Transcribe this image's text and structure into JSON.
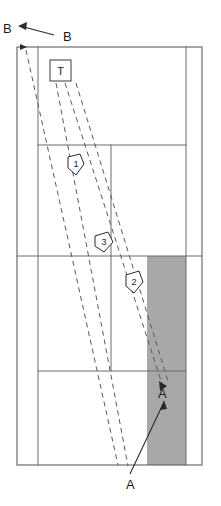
{
  "diagram": {
    "canvas": {
      "width": 221,
      "height": 506,
      "background": "#ffffff"
    },
    "colors": {
      "frame_stroke": "#5f5f5f",
      "inner_stroke": "#6b6b6b",
      "shaded_region_fill": "#a8a8a8",
      "dashed_line": "#5a5a5a",
      "leader_line": "#2b2b2b",
      "text": "#1a1a1a"
    },
    "outer_frame": {
      "x": 17,
      "y": 47,
      "width": 185,
      "height": 418
    },
    "shaded_region": {
      "x": 147,
      "y": 256,
      "width": 39,
      "height": 209,
      "fill": "#a8a8a8"
    },
    "vertical_dividers": [
      {
        "name": "left-divider",
        "x": 38,
        "y1": 47,
        "y2": 465
      },
      {
        "name": "center-divider",
        "x": 111,
        "y1": 145,
        "y2": 371
      },
      {
        "name": "right-divider",
        "x": 186,
        "y1": 47,
        "y2": 465
      }
    ],
    "horizontal_dividers": [
      {
        "name": "upper-divider",
        "y": 145,
        "x1": 38,
        "x2": 186
      },
      {
        "name": "middle-divider",
        "y": 256,
        "x1": 17,
        "x2": 202
      },
      {
        "name": "lower-divider",
        "y": 371,
        "x1": 38,
        "x2": 186
      }
    ],
    "sight_lines": [
      {
        "name": "sight-line-1",
        "x1": 26,
        "y1": 50,
        "x2": 118,
        "y2": 465
      },
      {
        "name": "sight-line-2",
        "x1": 56,
        "y1": 83,
        "x2": 128,
        "y2": 466
      },
      {
        "name": "sight-line-3",
        "x1": 65,
        "y1": 83,
        "x2": 163,
        "y2": 387
      },
      {
        "name": "sight-line-4",
        "x1": 76,
        "y1": 83,
        "x2": 168,
        "y2": 381
      }
    ],
    "labels": {
      "origin_marker": "B",
      "origin_leader": "B",
      "target_marker": "A",
      "target_leader": "A",
      "t_box": "T"
    },
    "callouts": [
      {
        "id": "callout-1",
        "label": "1",
        "x": 76,
        "y": 163
      },
      {
        "id": "callout-3",
        "label": "3",
        "x": 104,
        "y": 241
      },
      {
        "id": "callout-2",
        "label": "2",
        "x": 134,
        "y": 281
      }
    ],
    "leaders": [
      {
        "name": "leader-b",
        "label": "B",
        "text_x": 63,
        "text_y": 41,
        "line_x1": 54,
        "line_y1": 35,
        "line_x2": 18,
        "line_y2": 26,
        "arrow_at": "start-left"
      },
      {
        "name": "leader-a",
        "label": "A",
        "text_x": 126,
        "text_y": 487,
        "line_x1": 130,
        "line_y1": 474,
        "line_x2": 162,
        "line_y2": 403,
        "arrow_at": "end-top"
      }
    ],
    "marker_points": [
      {
        "name": "point-b",
        "label": "B",
        "x": 12,
        "y": 28,
        "text_x": 4,
        "text_y": 33
      },
      {
        "name": "point-a",
        "label": "A",
        "x": 163,
        "y": 387,
        "text_x": 160,
        "text_y": 394
      }
    ]
  }
}
